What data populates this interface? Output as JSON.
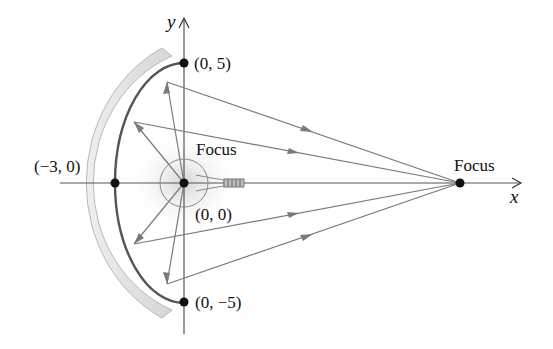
{
  "diagram": {
    "type": "elliptical reflector ray diagram",
    "axes": {
      "x_label": "x",
      "y_label": "y"
    },
    "points": [
      {
        "id": "top-vertex",
        "label": "(0, 5)"
      },
      {
        "id": "bottom-vertex",
        "label": "(0, −5)"
      },
      {
        "id": "left-vertex",
        "label": "(−3, 0)"
      },
      {
        "id": "origin-focus",
        "label": "(0, 0)"
      }
    ],
    "focus_labels": {
      "left": "Focus",
      "right": "Focus"
    },
    "colors": {
      "ray": "#7a7a7a",
      "mirror_band": "#dcdcdc",
      "ink": "#111111",
      "glow": "#d8d8d8"
    }
  }
}
